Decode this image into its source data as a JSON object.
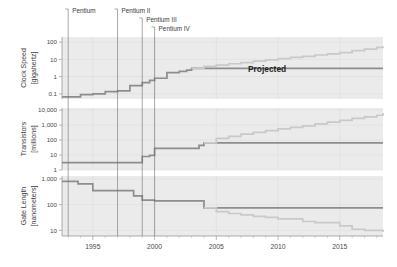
{
  "figure": {
    "projected_label": "Projected",
    "annotations": [
      {
        "label": "Pentium",
        "year": 1993.0
      },
      {
        "label": "Pentium II",
        "year": 1997.0
      },
      {
        "label": "Pentium III",
        "year": 1999.0
      },
      {
        "label": "Pentium IV",
        "year": 2000.0
      }
    ],
    "x_axis": {
      "label": "",
      "ticks": [
        1995,
        2000,
        2005,
        2010,
        2015
      ],
      "tick_labels": [
        "1995",
        "2000",
        "2005",
        "2010",
        "2015"
      ],
      "xlim": [
        1992.5,
        2018.5
      ],
      "minor_tick_step": 1
    },
    "panels": [
      {
        "name": "clock-speed",
        "axis_title_line1": "Clock Speed",
        "axis_title_line2": "[gigahertz]",
        "tick_labels": [
          "100",
          "10",
          "1",
          "0.1"
        ],
        "tick_values": [
          100,
          10,
          1,
          0.1
        ],
        "ylim": [
          0.05,
          200
        ]
      },
      {
        "name": "transistors",
        "axis_title_line1": "Transistors",
        "axis_title_line2": "[millions]",
        "tick_labels": [
          "10,000",
          "1,000",
          "100",
          "10",
          "1"
        ],
        "tick_values": [
          10000,
          1000,
          100,
          10,
          1
        ],
        "ylim": [
          1,
          14000
        ]
      },
      {
        "name": "gate-length",
        "axis_title_line1": "Gate Length",
        "axis_title_line2": "[nanometers]",
        "tick_labels": [
          "1,000",
          "100",
          "10"
        ],
        "tick_values": [
          1000,
          100,
          10
        ],
        "ylim": [
          6,
          1300
        ]
      }
    ]
  },
  "chart_data": [
    {
      "type": "line",
      "title": "Clock Speed [gigahertz]",
      "xlabel": "",
      "ylabel": "Clock Speed [gigahertz]",
      "yscale": "log",
      "ylim": [
        0.05,
        200
      ],
      "xlim": [
        1992.5,
        2018.5
      ],
      "grid": true,
      "step": "post",
      "series": [
        {
          "name": "Clock Speed (actual)",
          "color": "#8d8d8d",
          "x": [
            1992.5,
            1993.6,
            1994.0,
            1995.0,
            1996.0,
            1997.0,
            1998.0,
            1999.0,
            1999.6,
            2000.0,
            2001.0,
            2002.0,
            2002.6,
            2003.0
          ],
          "y": [
            0.066,
            0.066,
            0.09,
            0.1,
            0.133,
            0.15,
            0.3,
            0.45,
            0.6,
            0.8,
            1.7,
            2.0,
            2.4,
            3.0
          ]
        },
        {
          "name": "Clock Speed (projected)",
          "color": "#c9c9c9",
          "x": [
            2003.0,
            2004.0,
            2005.0,
            2006.0,
            2007.0,
            2008.0,
            2009.0,
            2010.0,
            2011.0,
            2012.0,
            2013.0,
            2014.0,
            2015.0,
            2016.0,
            2017.0,
            2018.0,
            2018.5
          ],
          "y": [
            3.0,
            4.0,
            4.6,
            5.6,
            6.5,
            8.0,
            9.5,
            11.0,
            13.0,
            15.0,
            18.0,
            21.0,
            25.0,
            32.0,
            40.0,
            50.0,
            58.0
          ]
        }
      ]
    },
    {
      "type": "line",
      "title": "Transistors [millions]",
      "xlabel": "",
      "ylabel": "Transistors [millions]",
      "yscale": "log",
      "ylim": [
        1,
        14000
      ],
      "xlim": [
        1992.5,
        2018.5
      ],
      "grid": true,
      "step": "post",
      "series": [
        {
          "name": "Transistors (actual)",
          "color": "#8d8d8d",
          "x": [
            1992.5,
            1997.0,
            1999.0,
            1999.6,
            2000.0,
            2003.6,
            2004.0
          ],
          "y": [
            3.1,
            3.1,
            8.0,
            9.5,
            28.0,
            45.0,
            65.0
          ]
        },
        {
          "name": "Transistors (projected)",
          "color": "#c9c9c9",
          "x": [
            2004.0,
            2005.0,
            2006.0,
            2007.0,
            2008.0,
            2009.0,
            2010.0,
            2011.0,
            2012.0,
            2013.0,
            2014.0,
            2015.0,
            2016.0,
            2017.0,
            2018.0,
            2018.5
          ],
          "y": [
            65.0,
            130.0,
            180.0,
            250.0,
            330.0,
            430.0,
            560.0,
            700.0,
            900.0,
            1200.0,
            1600.0,
            2100.0,
            2800.0,
            3600.0,
            4600.0,
            6500.0
          ]
        }
      ]
    },
    {
      "type": "line",
      "title": "Gate Length [nanometers]",
      "xlabel": "",
      "ylabel": "Gate Length [nanometers]",
      "yscale": "log",
      "ylim": [
        6,
        1300
      ],
      "xlim": [
        1992.5,
        2018.5
      ],
      "grid": true,
      "step": "post",
      "series": [
        {
          "name": "Gate Length (actual)",
          "color": "#8d8d8d",
          "x": [
            1992.5,
            1993.8,
            1995.0,
            1997.0,
            1998.3,
            1999.0,
            2000.0,
            2004.0
          ],
          "y": [
            800.0,
            640.0,
            350.0,
            350.0,
            220.0,
            150.0,
            140.0,
            75.0
          ]
        },
        {
          "name": "Gate Length (projected)",
          "color": "#c9c9c9",
          "x": [
            2004.0,
            2005.0,
            2006.0,
            2007.0,
            2008.0,
            2009.0,
            2010.0,
            2012.0,
            2013.0,
            2015.0,
            2016.0,
            2017.0,
            2018.5
          ],
          "y": [
            75.0,
            53.0,
            45.0,
            40.0,
            35.0,
            32.0,
            28.0,
            22.0,
            20.0,
            15.0,
            11.0,
            10.0,
            8.5
          ]
        }
      ]
    }
  ]
}
